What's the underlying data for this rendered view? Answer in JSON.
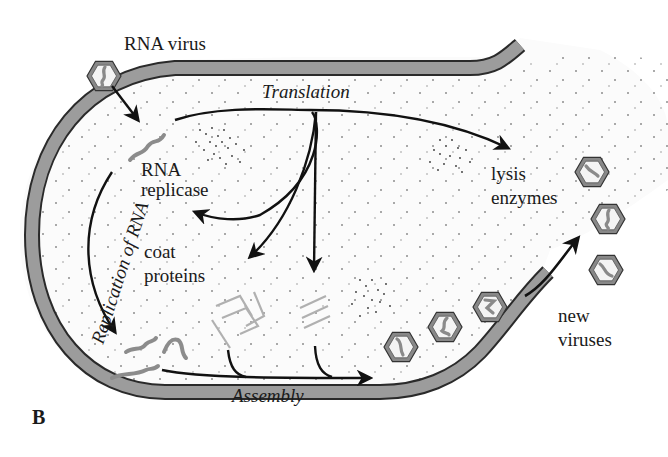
{
  "figure": {
    "panel_label": "B",
    "labels": {
      "rna_virus": "RNA virus",
      "translation": "Translation",
      "rna_replicase_line1": "RNA",
      "rna_replicase_line2": "replicase",
      "lysis_line1": "lysis",
      "lysis_line2": "enzymes",
      "coat_line1": "coat",
      "coat_line2": "proteins",
      "replication": "Replication of RNA",
      "assembly": "Assembly",
      "new_line1": "new",
      "new_line2": "viruses"
    },
    "colors": {
      "membrane": "#9a9a9a",
      "membrane_edge": "#2a2a2a",
      "cytoplasm": "#fbfbfb",
      "rna_strand": "#8c8c8c",
      "protein": "#b0b0b0",
      "arrow": "#111111",
      "capsid": "#7a7a7a"
    }
  }
}
